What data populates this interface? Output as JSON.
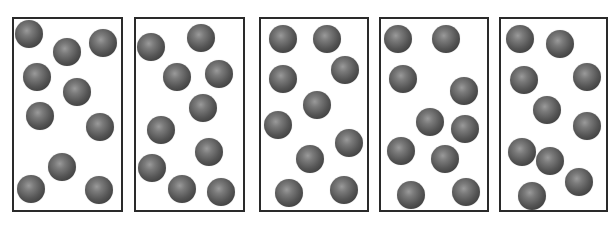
{
  "figure": {
    "sphere_radius": 14,
    "colors": {
      "border": "#2a2a2a",
      "sphere_highlight": "#9a9a9a",
      "sphere_shadow": "#333333",
      "background": "#ffffff"
    },
    "panels": [
      {
        "id": 1,
        "box": {
          "x": 12,
          "y": 17,
          "w": 111,
          "h": 195
        },
        "particle_count": 10,
        "particles": [
          [
            29,
            34
          ],
          [
            67,
            52
          ],
          [
            103,
            43
          ],
          [
            37,
            77
          ],
          [
            77,
            92
          ],
          [
            40,
            116
          ],
          [
            100,
            127
          ],
          [
            62,
            167
          ],
          [
            31,
            189
          ],
          [
            99,
            190
          ]
        ]
      },
      {
        "id": 2,
        "box": {
          "x": 134,
          "y": 17,
          "w": 111,
          "h": 195
        },
        "particle_count": 10,
        "particles": [
          [
            151,
            47
          ],
          [
            201,
            38
          ],
          [
            177,
            77
          ],
          [
            219,
            74
          ],
          [
            203,
            108
          ],
          [
            161,
            130
          ],
          [
            209,
            152
          ],
          [
            152,
            168
          ],
          [
            182,
            189
          ],
          [
            221,
            192
          ]
        ]
      },
      {
        "id": 3,
        "box": {
          "x": 259,
          "y": 17,
          "w": 110,
          "h": 195
        },
        "particle_count": 10,
        "particles": [
          [
            283,
            39
          ],
          [
            327,
            39
          ],
          [
            345,
            70
          ],
          [
            283,
            79
          ],
          [
            317,
            105
          ],
          [
            278,
            125
          ],
          [
            349,
            143
          ],
          [
            310,
            159
          ],
          [
            289,
            193
          ],
          [
            344,
            190
          ]
        ]
      },
      {
        "id": 4,
        "box": {
          "x": 379,
          "y": 17,
          "w": 110,
          "h": 195
        },
        "particle_count": 10,
        "particles": [
          [
            398,
            39
          ],
          [
            446,
            39
          ],
          [
            403,
            79
          ],
          [
            464,
            91
          ],
          [
            430,
            122
          ],
          [
            465,
            129
          ],
          [
            401,
            151
          ],
          [
            445,
            159
          ],
          [
            411,
            195
          ],
          [
            466,
            192
          ]
        ]
      },
      {
        "id": 5,
        "box": {
          "x": 499,
          "y": 17,
          "w": 109,
          "h": 195
        },
        "particle_count": 10,
        "particles": [
          [
            520,
            39
          ],
          [
            560,
            44
          ],
          [
            524,
            80
          ],
          [
            587,
            77
          ],
          [
            547,
            110
          ],
          [
            587,
            126
          ],
          [
            522,
            152
          ],
          [
            550,
            161
          ],
          [
            579,
            182
          ],
          [
            532,
            196
          ]
        ]
      }
    ]
  }
}
